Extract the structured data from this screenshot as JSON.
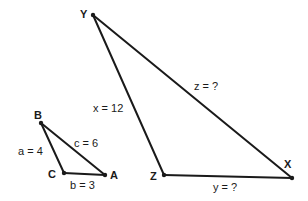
{
  "diagram": {
    "type": "similar-triangles",
    "small_triangle": {
      "vertices": {
        "B": {
          "label": "B",
          "x": 41,
          "y": 123
        },
        "C": {
          "label": "C",
          "x": 64,
          "y": 173
        },
        "A": {
          "label": "A",
          "x": 105,
          "y": 175
        }
      },
      "sides": {
        "a": {
          "label": "a = 4",
          "from": "B",
          "to": "C"
        },
        "b": {
          "label": "b = 3",
          "from": "C",
          "to": "A"
        },
        "c": {
          "label": "c = 6",
          "from": "B",
          "to": "A"
        }
      }
    },
    "large_triangle": {
      "vertices": {
        "Y": {
          "label": "Y",
          "x": 93,
          "y": 15
        },
        "Z": {
          "label": "Z",
          "x": 164,
          "y": 175
        },
        "X": {
          "label": "X",
          "x": 292,
          "y": 178
        }
      },
      "sides": {
        "x": {
          "label": "x = 12",
          "from": "Y",
          "to": "Z"
        },
        "y": {
          "label": "y = ?",
          "from": "Z",
          "to": "X"
        },
        "z": {
          "label": "z = ?",
          "from": "Y",
          "to": "X"
        }
      }
    }
  }
}
